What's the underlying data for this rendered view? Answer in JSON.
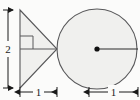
{
  "figure": {
    "background_color": "#fbfbfa",
    "shape_fill_color": "#f0f0ee",
    "stroke_color": "#58585a",
    "label_color": "#1a1a1a",
    "shapes": {
      "triangle": {
        "name": "right triangle",
        "vertices": "(20,10) (20,88) (57,49)",
        "height_label": "2",
        "base_label": "1",
        "right_angle_marker": true
      },
      "circle": {
        "name": "circle",
        "center_x": 97,
        "center_y": 49,
        "radius": 40,
        "radius_label": "1",
        "center_dot": true,
        "radius_line": true
      }
    },
    "dimensions": [
      {
        "id": "height",
        "label": "2",
        "orientation": "vertical",
        "position": "left"
      },
      {
        "id": "triangle-base",
        "label": "1",
        "orientation": "horizontal",
        "position": "bottom-left"
      },
      {
        "id": "circle-radius",
        "label": "1",
        "orientation": "horizontal",
        "position": "bottom-right"
      }
    ]
  }
}
